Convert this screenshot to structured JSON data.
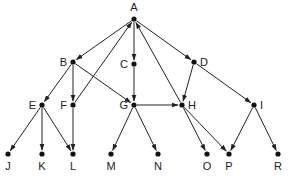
{
  "diagram": {
    "type": "directed-graph",
    "colors": {
      "ink": "#222222",
      "background": "#ffffff"
    },
    "nodes": [
      {
        "id": "A",
        "label": "A",
        "label_pos": "above"
      },
      {
        "id": "B",
        "label": "B",
        "label_pos": "left"
      },
      {
        "id": "C",
        "label": "C",
        "label_pos": "left"
      },
      {
        "id": "D",
        "label": "D",
        "label_pos": "right"
      },
      {
        "id": "E",
        "label": "E",
        "label_pos": "left"
      },
      {
        "id": "F",
        "label": "F",
        "label_pos": "left"
      },
      {
        "id": "G",
        "label": "G",
        "label_pos": "left"
      },
      {
        "id": "H",
        "label": "H",
        "label_pos": "right"
      },
      {
        "id": "I",
        "label": "I",
        "label_pos": "right"
      },
      {
        "id": "J",
        "label": "J",
        "label_pos": "below"
      },
      {
        "id": "K",
        "label": "K",
        "label_pos": "below"
      },
      {
        "id": "L",
        "label": "L",
        "label_pos": "below"
      },
      {
        "id": "M",
        "label": "M",
        "label_pos": "below"
      },
      {
        "id": "N",
        "label": "N",
        "label_pos": "below"
      },
      {
        "id": "O",
        "label": "O",
        "label_pos": "below"
      },
      {
        "id": "P",
        "label": "P",
        "label_pos": "below"
      },
      {
        "id": "R",
        "label": "R",
        "label_pos": "below"
      }
    ],
    "edges": [
      {
        "from": "A",
        "to": "B"
      },
      {
        "from": "A",
        "to": "C"
      },
      {
        "from": "A",
        "to": "D"
      },
      {
        "from": "F",
        "to": "A"
      },
      {
        "from": "H",
        "to": "A"
      },
      {
        "from": "B",
        "to": "E"
      },
      {
        "from": "B",
        "to": "F"
      },
      {
        "from": "B",
        "to": "G"
      },
      {
        "from": "C",
        "to": "G"
      },
      {
        "from": "D",
        "to": "H"
      },
      {
        "from": "D",
        "to": "I"
      },
      {
        "from": "G",
        "to": "H"
      },
      {
        "from": "E",
        "to": "J"
      },
      {
        "from": "E",
        "to": "K"
      },
      {
        "from": "E",
        "to": "L"
      },
      {
        "from": "F",
        "to": "L"
      },
      {
        "from": "G",
        "to": "M"
      },
      {
        "from": "G",
        "to": "N"
      },
      {
        "from": "H",
        "to": "O"
      },
      {
        "from": "H",
        "to": "P"
      },
      {
        "from": "I",
        "to": "P"
      },
      {
        "from": "I",
        "to": "R"
      }
    ]
  }
}
